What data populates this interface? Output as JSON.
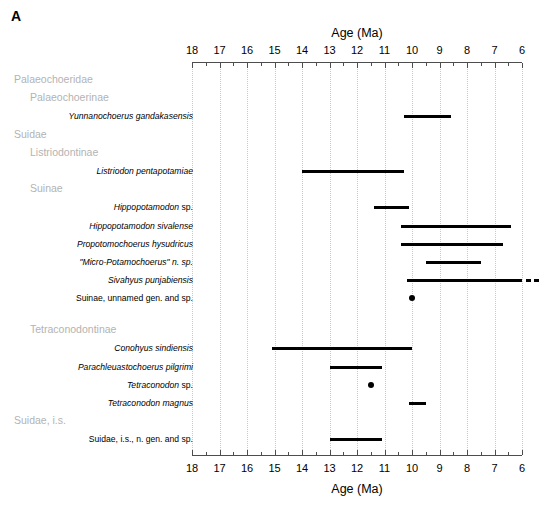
{
  "panel": {
    "label": "A"
  },
  "chart_data": {
    "type": "bar",
    "title": "",
    "xlabel": "Age (Ma)",
    "ylabel": "",
    "xlim": [
      18,
      6
    ],
    "x_reversed": true,
    "axis_title_top": "Age (Ma)",
    "axis_title_bottom": "Age (Ma)",
    "tick_values": [
      18,
      17,
      16,
      15,
      14,
      13,
      12,
      11,
      10,
      9,
      8,
      7,
      6
    ],
    "tick_labels": [
      "18",
      "17",
      "16",
      "15",
      "14",
      "13",
      "12",
      "11",
      "10",
      "9",
      "8",
      "7",
      "6"
    ],
    "minor_ticks": [
      17.5,
      16.5,
      15.5,
      14.5,
      13.5,
      12.5,
      11.5,
      10.5,
      9.5,
      8.5,
      7.5,
      6.5
    ],
    "grid": true,
    "grid_style": "dotted",
    "grid_color": "#c9c9c9",
    "bar_color": "#000000",
    "group_label_color": "#b3b3b3",
    "units": "Ma",
    "rows": [
      {
        "kind": "group",
        "label": "Palaeochoeridae",
        "indent": 0
      },
      {
        "kind": "group",
        "label": "Palaeochoerinae",
        "indent": 1
      },
      {
        "kind": "range",
        "label": "Yunnanochoerus gandakasensis",
        "italic": true,
        "start": 10.3,
        "end": 8.6
      },
      {
        "kind": "group",
        "label": "Suidae",
        "indent": 0
      },
      {
        "kind": "group",
        "label": "Listriodontinae",
        "indent": 1
      },
      {
        "kind": "range",
        "label": "Listriodon pentapotamiae",
        "italic": true,
        "start": 14.0,
        "end": 10.3
      },
      {
        "kind": "group",
        "label": "Suinae",
        "indent": 1
      },
      {
        "kind": "range",
        "label": "Hippopotamodon sp.",
        "italic": true,
        "italic_partial": "Hippopotamodon",
        "start": 11.4,
        "end": 10.1
      },
      {
        "kind": "range",
        "label": "Hippopotamodon sivalense",
        "italic": true,
        "start": 10.4,
        "end": 6.4
      },
      {
        "kind": "range",
        "label": "Propotomochoerus hysudricus",
        "italic": true,
        "start": 10.4,
        "end": 6.7
      },
      {
        "kind": "range",
        "label": "\"Micro-Potamochoerus\" n. sp.",
        "italic": true,
        "start": 9.5,
        "end": 7.5
      },
      {
        "kind": "range",
        "label": "Sivahyus punjabiensis",
        "italic": true,
        "start": 10.2,
        "end": 6.0,
        "open_end": true
      },
      {
        "kind": "point",
        "label": "Suinae, unnamed gen. and sp.",
        "italic": false,
        "value": 10.0
      },
      {
        "kind": "spacer"
      },
      {
        "kind": "group",
        "label": "Tetraconodontinae",
        "indent": 1
      },
      {
        "kind": "range",
        "label": "Conohyus sindiensis",
        "italic": true,
        "start": 15.1,
        "end": 10.0
      },
      {
        "kind": "range",
        "label": "Parachleuastochoerus pilgrimi",
        "italic": true,
        "start": 13.0,
        "end": 11.1
      },
      {
        "kind": "point",
        "label": "Tetraconodon sp.",
        "italic": true,
        "italic_partial": "Tetraconodon",
        "value": 11.5
      },
      {
        "kind": "range",
        "label": "Tetraconodon magnus",
        "italic": true,
        "start": 10.1,
        "end": 9.5
      },
      {
        "kind": "group",
        "label": "Suidae, i.s.",
        "indent": 0
      },
      {
        "kind": "range",
        "label": "Suidae, i.s., n. gen. and sp.",
        "italic": false,
        "start": 13.0,
        "end": 11.1
      }
    ]
  }
}
